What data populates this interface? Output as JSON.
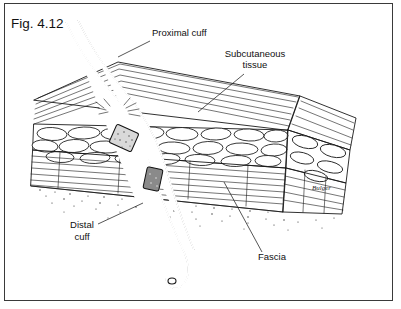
{
  "figure": {
    "caption": "Fig. 4.12",
    "artist_signature": "Bulger",
    "border_color": "#3a3a3a",
    "background_color": "#ffffff",
    "ink_color": "#1a1a1a"
  },
  "labels": [
    {
      "id": "proximal-cuff",
      "text_lines": [
        "Proximal cuff"
      ],
      "x": 152,
      "y": 36,
      "anchor": "start",
      "leader": "M150,41 L118,57"
    },
    {
      "id": "subcutaneous-tissue",
      "text_lines": [
        "Subcutaneous",
        "tissue"
      ],
      "x": 255,
      "y": 57,
      "anchor": "middle",
      "leader": "M244,74 L198,112"
    },
    {
      "id": "distal-cuff",
      "text_lines": [
        "Distal",
        "cuff"
      ],
      "x": 82,
      "y": 228,
      "anchor": "middle",
      "leader": "M98,224 L143,203"
    },
    {
      "id": "fascia",
      "text_lines": [
        "Fascia"
      ],
      "x": 272,
      "y": 260,
      "anchor": "middle",
      "leader": "M262,252 L224,182"
    }
  ],
  "anatomy": {
    "layers": [
      {
        "name": "skin",
        "description": "top surface with thin parallel striations"
      },
      {
        "name": "subcutaneous-tissue",
        "description": "fat lobule cells drawn as rounded blobs"
      },
      {
        "name": "fascia",
        "description": "striated fibrous sheet below the fat"
      },
      {
        "name": "muscle",
        "description": "lower striated layer with stippled cut edge"
      }
    ],
    "devices": [
      {
        "name": "catheter-tube",
        "description": "tunneled catheter entering skin and exiting below"
      },
      {
        "name": "proximal-cuff",
        "description": "textured cuff seated in the subcutaneous fat"
      },
      {
        "name": "distal-cuff",
        "description": "dark cuff seated at the fascia"
      },
      {
        "name": "exit-site",
        "description": "skin exit with radiating tissue marks"
      }
    ]
  }
}
